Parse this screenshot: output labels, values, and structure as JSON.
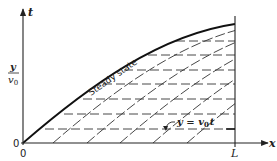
{
  "diagram": {
    "axes": {
      "vertical_label": "t",
      "horizontal_label": "x",
      "origin_x_label": "0",
      "origin_y_label": "0",
      "x_end_label": "L",
      "y_fraction_numerator": "y",
      "y_fraction_denominator": "v",
      "y_fraction_denominator_sub": "0"
    },
    "curves": {
      "steady_state_label": "Steady state",
      "characteristic_label_prefix": "y = v",
      "characteristic_label_sub": "0",
      "characteristic_label_suffix": "t"
    },
    "colors": {
      "ink": "#222222",
      "background": "#ffffff"
    },
    "geometry": {
      "origin": [
        23,
        143
      ],
      "x_axis_end": 268,
      "t_axis_top": 8,
      "L_x": 235,
      "horizontal_dashed_y": [
        41,
        55,
        70,
        84,
        99,
        114,
        129
      ],
      "characteristic_starts_x": [
        53,
        87,
        120,
        153,
        187
      ]
    }
  }
}
